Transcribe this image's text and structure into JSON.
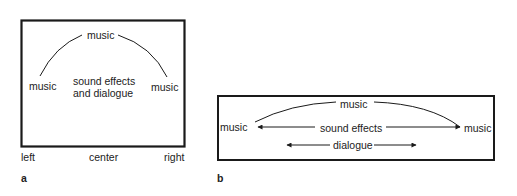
{
  "panel_a": {
    "letter": "a",
    "top_label": "music",
    "left_label": "music",
    "right_label": "music",
    "center_line1": "sound effects",
    "center_line2": "and dialogue",
    "axis_left": "left",
    "axis_center": "center",
    "axis_right": "right"
  },
  "panel_b": {
    "letter": "b",
    "top_label": "music",
    "left_label": "music",
    "right_label": "music",
    "middle_label": "sound effects",
    "bottom_label": "dialogue"
  },
  "colors": {
    "line": "#1a1a1a",
    "text": "#222222",
    "background": "#ffffff"
  }
}
